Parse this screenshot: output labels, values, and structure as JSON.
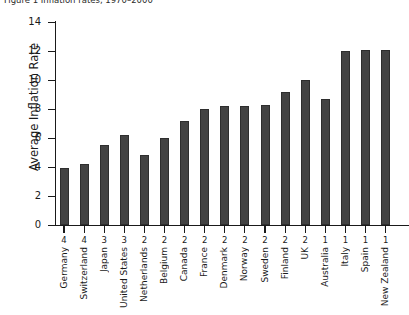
{
  "caption": {
    "text": "Figure 1  Inflation rates, 1970–2000"
  },
  "chart_data": {
    "type": "bar",
    "title": "",
    "xlabel": "",
    "ylabel": "Average Inflation Rate",
    "ylim": [
      0,
      14
    ],
    "yticks": [
      0,
      2,
      4,
      6,
      8,
      10,
      12,
      14
    ],
    "grid": false,
    "legend": null,
    "categories": [
      "Germany",
      "Switzerland",
      "Japan",
      "United States",
      "Netherlands",
      "Belgium",
      "Canada",
      "France",
      "Denmark",
      "Norway",
      "Sweden",
      "Finland",
      "UK",
      "Australia",
      "Italy",
      "Spain",
      "New Zealand"
    ],
    "values": [
      3.9,
      4.2,
      5.5,
      6.2,
      4.8,
      6.0,
      7.2,
      8.0,
      8.2,
      8.2,
      8.3,
      9.2,
      10.0,
      8.7,
      12.0,
      12.1,
      12.1
    ],
    "group_numbers": [
      "4",
      "4",
      "3",
      "3",
      "2",
      "2",
      "2",
      "2",
      "2",
      "2",
      "2",
      "2",
      "2",
      "1",
      "1",
      "1",
      "1"
    ],
    "bar_color": "#434343"
  }
}
